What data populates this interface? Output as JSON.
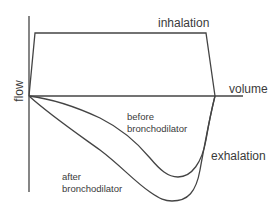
{
  "diagram": {
    "type": "flow-volume loop",
    "axes": {
      "y_label": "flow",
      "x_label": "volume"
    },
    "regions": {
      "upper": "inhalation",
      "lower": "exhalation"
    },
    "curves": [
      {
        "name": "before-bronchodilator",
        "label_line1": "before",
        "label_line2": "bronchodilator"
      },
      {
        "name": "after-bronchodilator",
        "label_line1": "after",
        "label_line2": "bronchodilator"
      }
    ],
    "colors": {
      "line": "#444444",
      "text": "#3a3a3a",
      "background": "#ffffff"
    }
  }
}
